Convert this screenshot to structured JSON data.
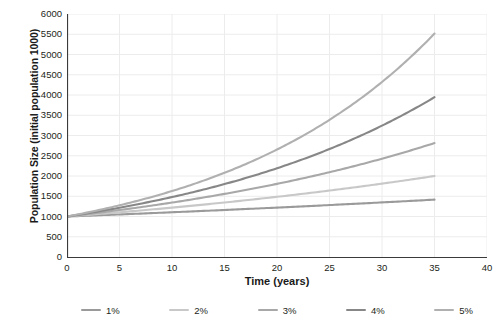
{
  "chart_data": {
    "type": "line",
    "title": "",
    "xlabel": "Time (years)",
    "ylabel": "Population Size (initial population 1000)",
    "xlim": [
      0,
      40
    ],
    "ylim": [
      0,
      6000
    ],
    "xticks": [
      0,
      5,
      10,
      15,
      20,
      25,
      30,
      35,
      40
    ],
    "yticks": [
      0,
      500,
      1000,
      1500,
      2000,
      2500,
      3000,
      3500,
      4000,
      4500,
      5000,
      5500,
      6000
    ],
    "xtick_labels": [
      "0",
      "5",
      "10",
      "15",
      "20",
      "25",
      "30",
      "35",
      "40"
    ],
    "ytick_labels": [
      "0",
      "500",
      "1000",
      "1500",
      "2000",
      "2500",
      "3000",
      "3500",
      "4000",
      "4500",
      "5000",
      "5500",
      "6000"
    ],
    "grid": true,
    "legend_position": "bottom",
    "initial_population": 1000,
    "x": [
      0,
      5,
      10,
      15,
      20,
      25,
      30,
      35
    ],
    "series": [
      {
        "name": "1%",
        "color": "#9a9a9a",
        "rate_percent": 1,
        "values": [
          1000,
          1051,
          1105,
          1161,
          1220,
          1282,
          1348,
          1417
        ]
      },
      {
        "name": "2%",
        "color": "#c8c8c8",
        "rate_percent": 2,
        "values": [
          1000,
          1104,
          1219,
          1346,
          1486,
          1641,
          1811,
          2000
        ]
      },
      {
        "name": "3%",
        "color": "#a8a8a8",
        "rate_percent": 3,
        "values": [
          1000,
          1159,
          1344,
          1558,
          1806,
          2094,
          2427,
          2814
        ]
      },
      {
        "name": "4%",
        "color": "#878787",
        "rate_percent": 4,
        "values": [
          1000,
          1217,
          1480,
          1801,
          2191,
          2666,
          3243,
          3946
        ]
      },
      {
        "name": "5%",
        "color": "#b0b0b0",
        "rate_percent": 5,
        "values": [
          1000,
          1276,
          1629,
          2079,
          2653,
          3386,
          4322,
          5516
        ]
      }
    ],
    "legend": [
      {
        "label": "1%",
        "color": "#9a9a9a"
      },
      {
        "label": "2%",
        "color": "#c8c8c8"
      },
      {
        "label": "3%",
        "color": "#a8a8a8"
      },
      {
        "label": "4%",
        "color": "#878787"
      },
      {
        "label": "5%",
        "color": "#b0b0b0"
      }
    ],
    "colors": {
      "axis": "#3a3a3a",
      "grid": "#ececec",
      "background": "#ffffff",
      "text": "#231f20"
    }
  }
}
